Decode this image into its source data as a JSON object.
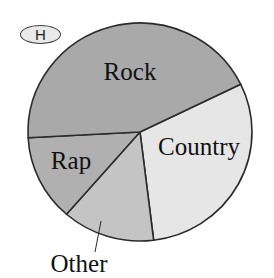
{
  "badge": {
    "label": "H"
  },
  "chart_data": {
    "type": "pie",
    "title": "",
    "categories": [
      "Country",
      "Other",
      "Rap",
      "Rock"
    ],
    "values": [
      30,
      13,
      13,
      44
    ],
    "unit": "percent (estimated from slice angles; no values printed)",
    "slices": [
      {
        "label": "Country",
        "value": 30,
        "start_deg": -26,
        "end_deg": 83,
        "color": "#e6e6e6",
        "label_x": 199,
        "label_y": 155,
        "label_anchor": "middle"
      },
      {
        "label": "Other",
        "value": 13,
        "start_deg": 83,
        "end_deg": 131,
        "color": "#c4c4c4",
        "label_x": 79,
        "label_y": 272,
        "label_anchor": "middle",
        "leader": {
          "x1": 101,
          "y1": 221,
          "x2": 95,
          "y2": 252
        }
      },
      {
        "label": "Rap",
        "value": 13,
        "start_deg": 131,
        "end_deg": 177,
        "color": "#b0b0b0",
        "label_x": 71,
        "label_y": 169,
        "label_anchor": "middle"
      },
      {
        "label": "Rock",
        "value": 44,
        "start_deg": 177,
        "end_deg": 334,
        "color": "#a9a9a9",
        "label_x": 130,
        "label_y": 80,
        "label_anchor": "middle"
      }
    ],
    "center": {
      "x": 140,
      "y": 132
    },
    "radius": {
      "rx": 112,
      "ry": 109
    },
    "stroke_color": "#2b2b2b",
    "legend": "none (labels placed on slices)"
  }
}
